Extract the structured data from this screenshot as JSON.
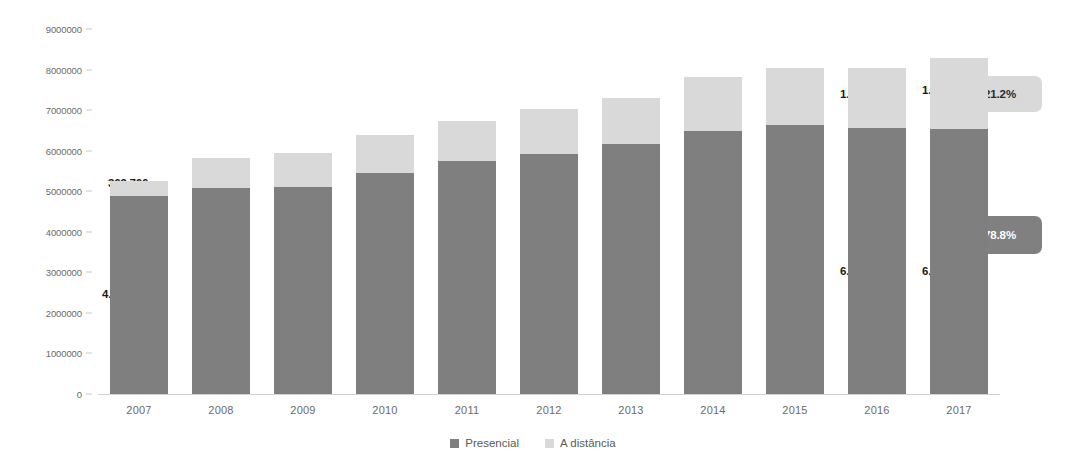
{
  "chart_data": {
    "type": "bar",
    "subtype": "stacked-column",
    "title": "",
    "xlabel": "",
    "ylabel": "",
    "categories": [
      "2007",
      "2008",
      "2009",
      "2010",
      "2011",
      "2012",
      "2013",
      "2014",
      "2015",
      "2016",
      "2017"
    ],
    "series": [
      {
        "name": "Presencial",
        "color": "#7f7f7f",
        "values": [
          4880381,
          5080056,
          5115896,
          5449120,
          5746762,
          5923838,
          6152405,
          6486171,
          6633545,
          6554283,
          6529681
        ]
      },
      {
        "name": "A distância",
        "color": "#d9d9d9",
        "values": [
          369766,
          727961,
          838125,
          930179,
          992927,
          1113850,
          1153572,
          1341842,
          1393752,
          1494418,
          1756982
        ]
      }
    ],
    "ylim": [
      0,
      9000000
    ],
    "y_ticks": [
      "0",
      "1000000",
      "2000000",
      "3000000",
      "4000000",
      "5000000",
      "6000000",
      "7000000",
      "8000000",
      "9000000"
    ],
    "y_tick_values": [
      0,
      1000000,
      2000000,
      3000000,
      4000000,
      5000000,
      6000000,
      7000000,
      8000000,
      9000000
    ],
    "grid": false,
    "legend_position": "bottom",
    "visible_value_labels": [
      {
        "category": "2007",
        "series": "A distância",
        "text": "369.766"
      },
      {
        "category": "2007",
        "series": "Presencial",
        "text": "4.880.381"
      },
      {
        "category": "2016",
        "series": "A distância",
        "text": "1.494.418"
      },
      {
        "category": "2016",
        "series": "Presencial",
        "text": "6.554.283"
      },
      {
        "category": "2017",
        "series": "A distância",
        "text": "1.756.982"
      },
      {
        "category": "2017",
        "series": "Presencial",
        "text": "6.529.681"
      }
    ],
    "annotations": [
      {
        "text": "21.2%",
        "target_series": "A distância",
        "target_category": "2017",
        "style": "light-callout"
      },
      {
        "text": "78.8%",
        "target_series": "Presencial",
        "target_category": "2017",
        "style": "dark-callout"
      }
    ]
  },
  "legend": {
    "items": [
      {
        "label": "Presencial",
        "color": "#7f7f7f"
      },
      {
        "label": "A distância",
        "color": "#d9d9d9"
      }
    ]
  },
  "y_axis": {
    "ticks": [
      "9000000",
      "8000000",
      "7000000",
      "6000000",
      "5000000",
      "4000000",
      "3000000",
      "2000000",
      "1000000",
      "0"
    ]
  },
  "x_axis": {
    "ticks": [
      "2007",
      "2008",
      "2009",
      "2010",
      "2011",
      "2012",
      "2013",
      "2014",
      "2015",
      "2016",
      "2017"
    ]
  },
  "labels": {
    "y2007_dist": "369.766",
    "y2007_pres": "4.880.381",
    "y2016_dist": "1.494.418",
    "y2016_pres": "6.554.283",
    "y2017_dist": "1.756.982",
    "y2017_pres": "6.529.681"
  },
  "callouts": {
    "top": "21.2%",
    "bottom": "78.8%"
  }
}
